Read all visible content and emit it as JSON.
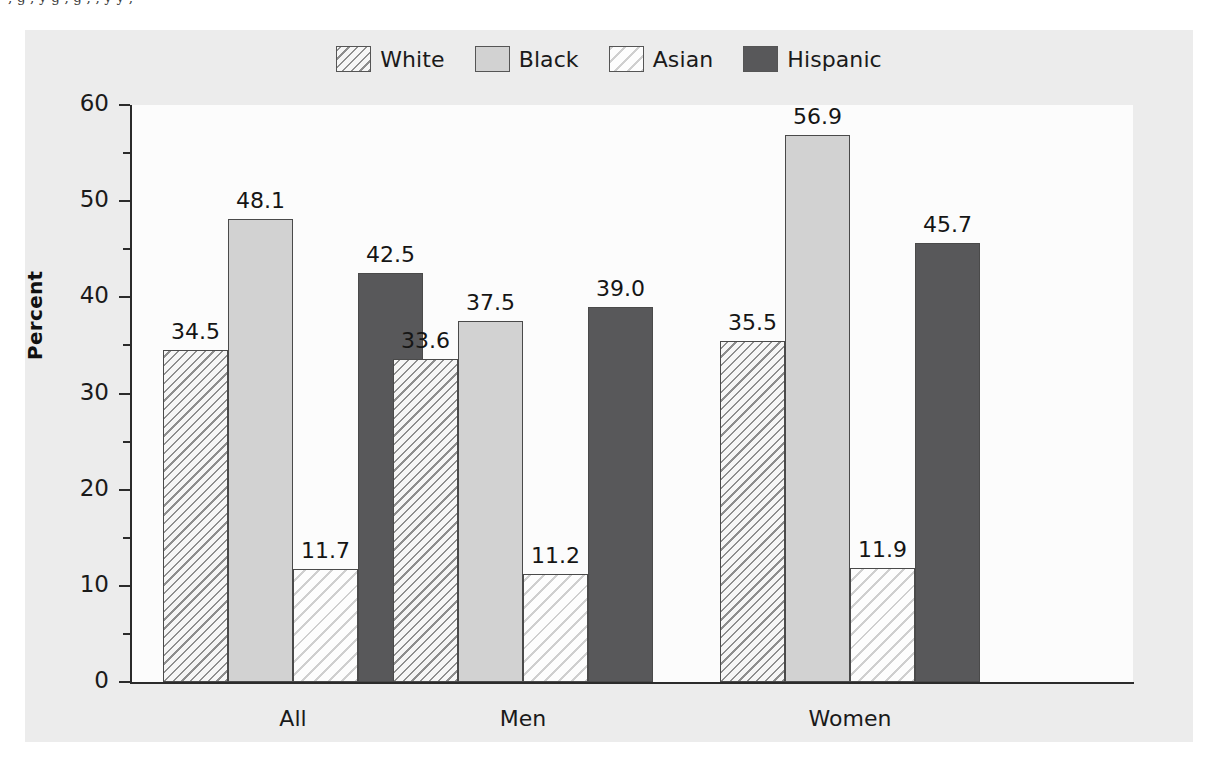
{
  "top_text_sliver": "     ,        g            ,          y        g  ,          g        ,       ,       y     y   ,",
  "figure": {
    "legend": [
      {
        "label": "White",
        "pattern": "hatch-dense",
        "color": "#8e8e8e"
      },
      {
        "label": "Black",
        "pattern": "solid-light",
        "color": "#d2d2d2"
      },
      {
        "label": "Asian",
        "pattern": "hatch-light",
        "color": "#cfcfcf"
      },
      {
        "label": "Hispanic",
        "pattern": "solid-dark",
        "color": "#58585a"
      }
    ],
    "y_axis_label": "Percent",
    "y_ticks": [
      "0",
      "10",
      "20",
      "30",
      "40",
      "50",
      "60"
    ],
    "y_minor_ticks": [
      "5",
      "15",
      "25",
      "35",
      "45",
      "55"
    ],
    "x_categories": [
      "All",
      "Men",
      "Women"
    ]
  },
  "chart_data": {
    "type": "bar",
    "title": "",
    "xlabel": "",
    "ylabel": "Percent",
    "ylim": [
      0,
      60
    ],
    "ytick_step": 10,
    "yminor_step": 5,
    "grid": false,
    "legend_position": "top-center",
    "categories": [
      "All",
      "Men",
      "Women"
    ],
    "series": [
      {
        "name": "White",
        "values": [
          34.5,
          33.6,
          35.5
        ],
        "labels": [
          "34.5",
          "33.6",
          "35.5"
        ]
      },
      {
        "name": "Black",
        "values": [
          48.1,
          37.5,
          56.9
        ],
        "labels": [
          "48.1",
          "37.5",
          "56.9"
        ]
      },
      {
        "name": "Asian",
        "values": [
          11.7,
          11.2,
          11.9
        ],
        "labels": [
          "11.7",
          "11.2",
          "11.9"
        ]
      },
      {
        "name": "Hispanic",
        "values": [
          42.5,
          39.0,
          45.7
        ],
        "labels": [
          "42.5",
          "39.0",
          "45.7"
        ]
      }
    ]
  }
}
